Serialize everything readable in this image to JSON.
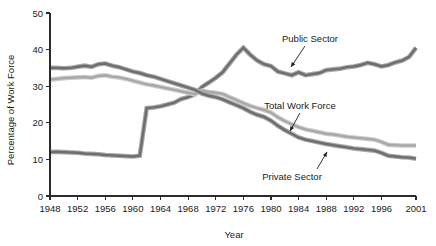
{
  "chart_data": {
    "type": "line",
    "title": "",
    "xlabel": "Year",
    "ylabel": "Percentage of Work Force",
    "xlim": [
      1948,
      2001
    ],
    "ylim": [
      0,
      50
    ],
    "grid": false,
    "legend_position": "inline-annotations",
    "x_ticks": [
      1948,
      1952,
      1956,
      1960,
      1964,
      1968,
      1972,
      1976,
      1980,
      1984,
      1988,
      1992,
      1996,
      2001
    ],
    "x_tick_labels": [
      "1948",
      "1952",
      "1956",
      "1960",
      "1964",
      "1968",
      "1972",
      "1976",
      "1980",
      "1984",
      "1988",
      "1992",
      "1996",
      "2001"
    ],
    "y_ticks": [
      0,
      10,
      20,
      30,
      40,
      50
    ],
    "y_tick_labels": [
      "0",
      "10",
      "20",
      "30",
      "40",
      "50"
    ],
    "x": [
      1948,
      1949,
      1950,
      1951,
      1952,
      1953,
      1954,
      1955,
      1956,
      1957,
      1958,
      1959,
      1960,
      1961,
      1962,
      1963,
      1964,
      1965,
      1966,
      1967,
      1968,
      1969,
      1970,
      1971,
      1972,
      1973,
      1974,
      1975,
      1976,
      1977,
      1978,
      1979,
      1980,
      1981,
      1982,
      1983,
      1984,
      1985,
      1986,
      1987,
      1988,
      1989,
      1990,
      1991,
      1992,
      1993,
      1994,
      1995,
      1996,
      1997,
      1998,
      1999,
      2000,
      2001
    ],
    "series": [
      {
        "name": "Public Sector",
        "color": "#6e6e6e",
        "halo_color": "#a8a8a8",
        "values": [
          12.0,
          12.1,
          12.0,
          11.9,
          11.8,
          11.6,
          11.5,
          11.4,
          11.2,
          11.1,
          11.0,
          10.9,
          10.8,
          11.0,
          24.0,
          24.2,
          24.5,
          25.0,
          25.5,
          26.5,
          27.0,
          27.8,
          29.8,
          31.0,
          32.3,
          33.8,
          36.2,
          38.6,
          40.5,
          38.6,
          37.0,
          36.0,
          35.5,
          34.0,
          33.5,
          33.0,
          33.8,
          33.0,
          33.3,
          33.6,
          34.4,
          34.6,
          34.8,
          35.2,
          35.4,
          35.8,
          36.4,
          36.0,
          35.4,
          35.8,
          36.5,
          37.0,
          38.0,
          40.5
        ]
      },
      {
        "name": "Total Work Force",
        "color": "#a8a8a8",
        "halo_color": "#cfcfcf",
        "values": [
          31.8,
          32.0,
          32.2,
          32.3,
          32.4,
          32.5,
          32.3,
          32.8,
          33.0,
          32.6,
          32.4,
          32.0,
          31.5,
          31.0,
          30.5,
          30.2,
          29.8,
          29.4,
          29.0,
          28.6,
          28.2,
          27.8,
          28.8,
          28.4,
          28.2,
          27.9,
          27.0,
          26.2,
          25.4,
          24.6,
          24.0,
          23.5,
          22.8,
          21.5,
          20.5,
          19.6,
          18.8,
          18.2,
          17.8,
          17.4,
          17.0,
          16.8,
          16.5,
          16.2,
          16.0,
          15.8,
          15.6,
          15.4,
          14.8,
          14.0,
          13.9,
          13.8,
          13.8,
          13.8
        ]
      },
      {
        "name": "Private Sector",
        "color": "#6e6e6e",
        "halo_color": "#a8a8a8",
        "values": [
          35.0,
          35.0,
          34.9,
          35.0,
          35.3,
          35.6,
          35.3,
          36.0,
          36.2,
          35.6,
          35.2,
          34.6,
          34.0,
          33.6,
          33.0,
          32.6,
          32.0,
          31.4,
          30.8,
          30.2,
          29.6,
          29.0,
          28.0,
          27.4,
          27.0,
          26.4,
          25.6,
          24.8,
          24.0,
          23.0,
          22.2,
          21.6,
          20.6,
          19.2,
          18.0,
          17.0,
          16.0,
          15.4,
          15.0,
          14.6,
          14.2,
          13.9,
          13.6,
          13.3,
          13.0,
          12.8,
          12.6,
          12.4,
          11.8,
          11.0,
          10.8,
          10.6,
          10.5,
          10.2
        ]
      }
    ],
    "annotations": [
      {
        "label": "Public Sector",
        "text_x": 310,
        "text_y": 42,
        "arrow_x1": 305,
        "arrow_y1": 46,
        "arrow_x2": 291,
        "arrow_y2": 67
      },
      {
        "label": "Total Work Force",
        "text_x": 300,
        "text_y": 109,
        "arrow_x1": 300,
        "arrow_y1": 113,
        "arrow_x2": 290,
        "arrow_y2": 131
      },
      {
        "label": "Private Sector",
        "text_x": 292,
        "text_y": 180,
        "arrow_x1": 317,
        "arrow_y1": 169,
        "arrow_x2": 327,
        "arrow_y2": 152
      }
    ]
  }
}
